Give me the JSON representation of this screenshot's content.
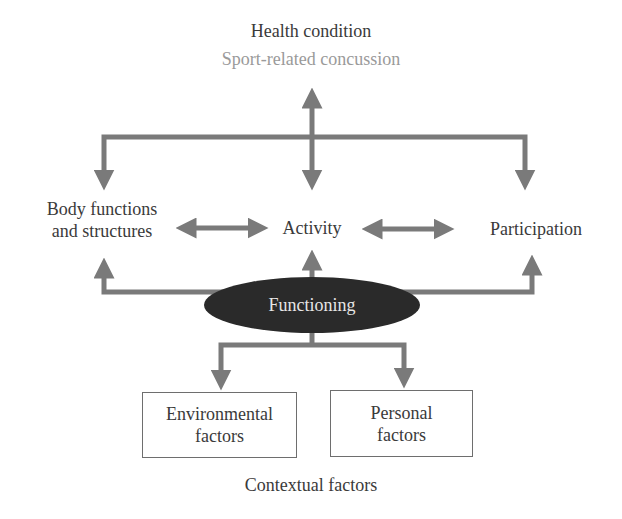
{
  "diagram": {
    "type": "ICF framework diagram",
    "health_condition": {
      "title": "Health condition",
      "subtitle": "Sport-related concussion"
    },
    "components": {
      "body_functions": {
        "line1": "Body functions",
        "line2": "and structures"
      },
      "activity": "Activity",
      "participation": "Participation"
    },
    "center": {
      "label": "Functioning"
    },
    "contextual": {
      "environmental": {
        "line1": "Environmental",
        "line2": "factors"
      },
      "personal": {
        "line1": "Personal",
        "line2": "factors"
      },
      "caption": "Contextual factors"
    },
    "colors": {
      "arrow": "#7a7a7a",
      "ellipse": "#2a2a2a",
      "text": "#3a3a3a",
      "subtitle": "#9a9a9a",
      "ellipse_text": "#e6e6e6",
      "box_border": "#6e6e6e"
    }
  }
}
